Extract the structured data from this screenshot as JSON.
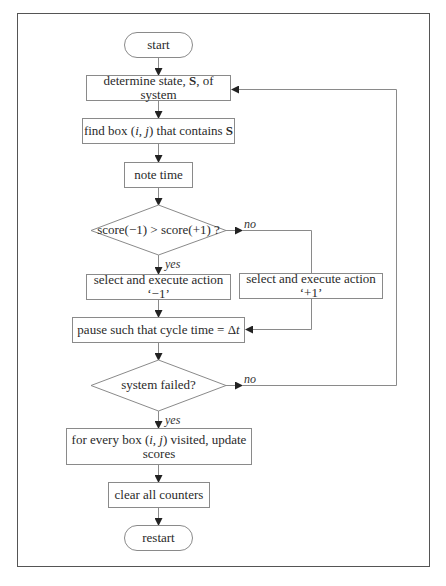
{
  "flowchart": {
    "nodes": {
      "start": "start",
      "determine_state": "determine state, S, of system",
      "find_box": "find box (i, j) that contains S",
      "note_time": "note time",
      "decision_score": "score(−1) > score(+1) ?",
      "action_minus": "select and execute action ‘−1’",
      "action_plus": "select and execute action ‘+1’",
      "pause": "pause such that cycle time = Δt",
      "decision_failed": "system failed?",
      "update_scores_line1": "for every box (i, j) visited, update",
      "update_scores_line2": "scores",
      "clear_counters": "clear all counters",
      "restart": "restart"
    },
    "labels": {
      "score_yes": "yes",
      "score_no": "no",
      "failed_yes": "yes",
      "failed_no": "no"
    },
    "colors": {
      "box_border": "#8a8a8a",
      "frame_border": "#555555",
      "arrow": "#222222",
      "text": "#2a2a2a"
    }
  }
}
